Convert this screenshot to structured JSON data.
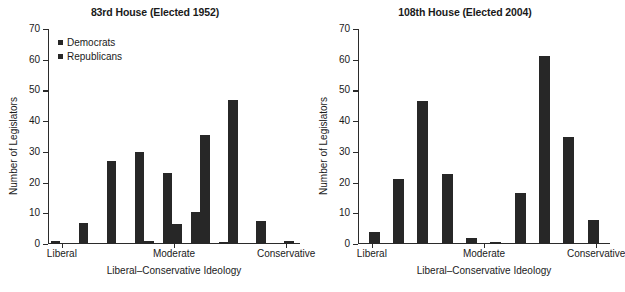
{
  "figure": {
    "panels": [
      {
        "id": "panel-83rd",
        "title": "83rd House (Elected 1952)",
        "xlabel": "Liberal–Conservative Ideology",
        "ylabel": "Number of Legislators"
      },
      {
        "id": "panel-108th",
        "title": "108th House (Elected 2004)",
        "xlabel": "Liberal–Conservative Ideology",
        "ylabel": "Number of Legislators"
      }
    ],
    "legend": {
      "democrats_label": "Democrats",
      "republicans_label": "Republicans",
      "swatch_color": "#272727"
    },
    "axis_color": "#2b2b2b",
    "bar_color": "#272727"
  },
  "chart_data": [
    {
      "type": "bar",
      "title": "83rd House (Elected 1952)",
      "xlabel": "Liberal–Conservative Ideology",
      "ylabel": "Number of Legislators",
      "ylim": [
        0,
        70
      ],
      "yticks": [
        0,
        10,
        20,
        30,
        40,
        50,
        60,
        70
      ],
      "ytick_labels": [
        "0",
        "10",
        "20",
        "30",
        "40",
        "50",
        "60",
        "70"
      ],
      "xtick_positions": [
        0.055,
        0.5,
        0.945
      ],
      "xtick_labels": [
        "Liberal",
        "Moderate",
        "Conservative"
      ],
      "grid": false,
      "legend_position": "top-left",
      "categories": [
        "1",
        "2",
        "3",
        "4",
        "5",
        "6",
        "7",
        "8",
        "9"
      ],
      "series": [
        {
          "name": "Democrats",
          "values": [
            1,
            7,
            27,
            30,
            23,
            10.5,
            0.5,
            0,
            0
          ]
        },
        {
          "name": "Republicans",
          "values": [
            0,
            0,
            0,
            1,
            6.5,
            35.5,
            47,
            7.5,
            1
          ]
        }
      ]
    },
    {
      "type": "bar",
      "title": "108th House (Elected 2004)",
      "xlabel": "Liberal–Conservative Ideology",
      "ylabel": "Number of Legislators",
      "ylim": [
        0,
        70
      ],
      "yticks": [
        0,
        10,
        20,
        30,
        40,
        50,
        60,
        70
      ],
      "ytick_labels": [
        "0",
        "10",
        "20",
        "30",
        "40",
        "50",
        "60",
        "70"
      ],
      "xtick_positions": [
        0.055,
        0.5,
        0.945
      ],
      "xtick_labels": [
        "Liberal",
        "Moderate",
        "Conservative"
      ],
      "grid": false,
      "legend_position": "none",
      "categories": [
        "1",
        "2",
        "3",
        "4",
        "5",
        "6",
        "7",
        "8",
        "9",
        "10"
      ],
      "series": [
        {
          "name": "All Legislators",
          "values": [
            4,
            21.2,
            46.5,
            22.7,
            2,
            0.8,
            16.7,
            61.3,
            34.7,
            7.8
          ]
        }
      ]
    }
  ]
}
